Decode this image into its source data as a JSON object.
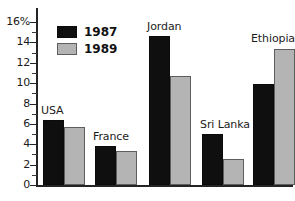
{
  "chart_data": {
    "type": "bar",
    "title": "",
    "xlabel": "",
    "ylabel": "",
    "ylim": [
      0,
      16
    ],
    "ytick_step": 2,
    "ytick_minor_step": 1,
    "grid": false,
    "legend_position": "top-left-inside",
    "categories": [
      "USA",
      "France",
      "Jordan",
      "Sri Lanka",
      "Ethiopia"
    ],
    "series": [
      {
        "name": "1987",
        "color": "#100f0f",
        "values": [
          6.4,
          3.8,
          14.6,
          5.0,
          9.9
        ]
      },
      {
        "name": "1989",
        "color": "#b4b4b4",
        "values": [
          5.7,
          3.3,
          10.7,
          2.6,
          13.4
        ]
      }
    ],
    "ytick_labels": [
      "16%",
      "14",
      "12",
      "10",
      "8",
      "6",
      "4",
      "2",
      "0"
    ],
    "ytick_values": [
      16,
      14,
      12,
      10,
      8,
      6,
      4,
      2,
      0
    ],
    "axis_unit": "%"
  },
  "legend": {
    "items": [
      {
        "label": "1987",
        "swatch": "black-swatch"
      },
      {
        "label": "1989",
        "swatch": "gray-swatch"
      }
    ]
  },
  "caption": {
    "partial_text": ""
  }
}
